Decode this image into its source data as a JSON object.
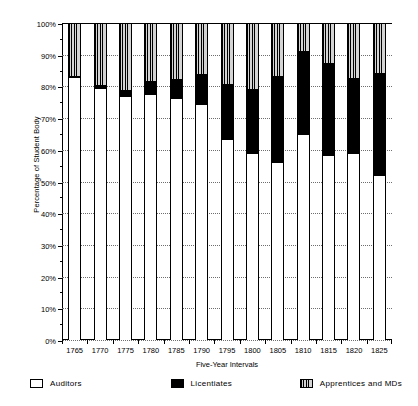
{
  "chart_data": {
    "type": "bar",
    "subtype": "stacked-100-percent",
    "title": "",
    "xlabel": "Five-Year Intervals",
    "ylabel": "Percentage of Student Body",
    "categories": [
      "1765",
      "1770",
      "1775",
      "1780",
      "1785",
      "1790",
      "1795",
      "1800",
      "1805",
      "1810",
      "1815",
      "1820",
      "1825"
    ],
    "series": [
      {
        "name": "Auditors",
        "fill": "white",
        "values": [
          83,
          79.5,
          77,
          77.5,
          76.5,
          74.5,
          63.5,
          59,
          56,
          65,
          58.5,
          59,
          52
        ]
      },
      {
        "name": "Licentiates",
        "fill": "black",
        "values": [
          0,
          0.5,
          1.5,
          4,
          5.5,
          9,
          17,
          20,
          27,
          26,
          28.5,
          23.5,
          32
        ]
      },
      {
        "name": "Apprentices and MDs",
        "fill": "vertical-stripes",
        "values": [
          17,
          20,
          21.5,
          18.5,
          18,
          16.5,
          19.5,
          21,
          17,
          9,
          13,
          17.5,
          16
        ]
      }
    ],
    "ylim": [
      0,
      100
    ],
    "ytick_labels": [
      "0%",
      "10%",
      "20%",
      "30%",
      "40%",
      "50%",
      "60%",
      "70%",
      "80%",
      "90%",
      "100%"
    ],
    "ytick_values": [
      0,
      10,
      20,
      30,
      40,
      50,
      60,
      70,
      80,
      90,
      100
    ],
    "grid": true,
    "grid_axis": "y",
    "legend_position": "bottom",
    "legend": [
      "Auditors",
      "Licentiates",
      "Apprentices and MDs"
    ],
    "colors": {
      "auditors": "#ffffff",
      "licentiates": "#000000",
      "apprentices": "#d4d4d4",
      "axis": "#000000",
      "gridline": "#6e6e6e"
    }
  }
}
